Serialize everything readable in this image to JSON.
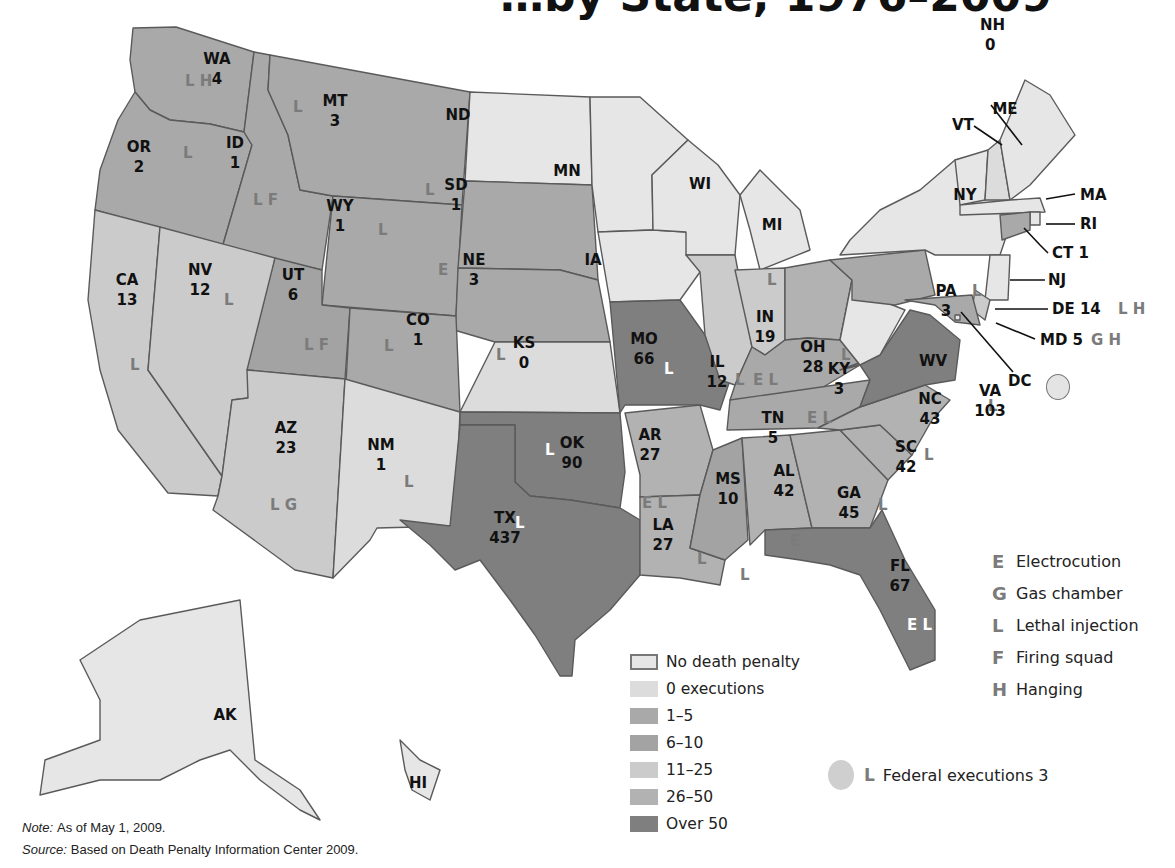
{
  "title_fragment": "…by State, 1976–2009",
  "colors": {
    "no_death_penalty": "#e6e6e6",
    "zero_executions": "#dcdcdc",
    "range_1_5": "#a9a9a9",
    "range_6_10": "#a3a3a3",
    "range_11_25": "#cbcbcb",
    "range_26_50": "#b2b2b2",
    "over_50": "#7f7f7f",
    "method_code": "#7b7b7b"
  },
  "legend_fill": [
    {
      "key": "no_death_penalty",
      "label": "No death penalty"
    },
    {
      "key": "zero_executions",
      "label": "0 executions"
    },
    {
      "key": "range_1_5",
      "label": "1–5"
    },
    {
      "key": "range_6_10",
      "label": "6–10"
    },
    {
      "key": "range_11_25",
      "label": "11–25"
    },
    {
      "key": "range_26_50",
      "label": "26–50"
    },
    {
      "key": "over_50",
      "label": "Over 50"
    }
  ],
  "legend_methods": [
    {
      "code": "E",
      "label": "Electrocution"
    },
    {
      "code": "G",
      "label": "Gas chamber"
    },
    {
      "code": "L",
      "label": "Lethal injection"
    },
    {
      "code": "F",
      "label": "Firing squad"
    },
    {
      "code": "H",
      "label": "Hanging"
    }
  ],
  "federal": {
    "code": "L",
    "label": "Federal executions 3"
  },
  "notes": {
    "note_label": "Note:",
    "note_text": "As of May 1, 2009.",
    "source_label": "Source:",
    "source_text": "Based on Death Penalty Information Center 2009."
  },
  "states": [
    {
      "abbr": "WA",
      "executions": "4",
      "methods": "L H",
      "category": "range_1_5"
    },
    {
      "abbr": "OR",
      "executions": "2",
      "methods": "L",
      "category": "range_1_5"
    },
    {
      "abbr": "ID",
      "executions": "1",
      "methods": "L F",
      "category": "range_1_5"
    },
    {
      "abbr": "MT",
      "executions": "3",
      "methods": "L",
      "category": "range_1_5"
    },
    {
      "abbr": "WY",
      "executions": "1",
      "methods": "L",
      "category": "range_1_5"
    },
    {
      "abbr": "ND",
      "executions": "",
      "methods": "",
      "category": "no_death_penalty"
    },
    {
      "abbr": "SD",
      "executions": "1",
      "methods": "L",
      "category": "range_1_5"
    },
    {
      "abbr": "NE",
      "executions": "3",
      "methods": "E",
      "category": "range_1_5"
    },
    {
      "abbr": "CA",
      "executions": "13",
      "methods": "L",
      "category": "range_11_25"
    },
    {
      "abbr": "NV",
      "executions": "12",
      "methods": "L",
      "category": "range_11_25"
    },
    {
      "abbr": "UT",
      "executions": "6",
      "methods": "L F",
      "category": "range_6_10"
    },
    {
      "abbr": "CO",
      "executions": "1",
      "methods": "L",
      "category": "range_1_5"
    },
    {
      "abbr": "KS",
      "executions": "0",
      "methods": "L",
      "category": "zero_executions"
    },
    {
      "abbr": "AZ",
      "executions": "23",
      "methods": "L G",
      "category": "range_11_25"
    },
    {
      "abbr": "NM",
      "executions": "1",
      "methods": "L",
      "category": "zero_executions"
    },
    {
      "abbr": "OK",
      "executions": "90",
      "methods": "L",
      "category": "over_50"
    },
    {
      "abbr": "TX",
      "executions": "437",
      "methods": "L",
      "category": "over_50"
    },
    {
      "abbr": "MN",
      "executions": "",
      "methods": "",
      "category": "no_death_penalty"
    },
    {
      "abbr": "IA",
      "executions": "",
      "methods": "",
      "category": "no_death_penalty"
    },
    {
      "abbr": "MO",
      "executions": "66",
      "methods": "L",
      "category": "over_50"
    },
    {
      "abbr": "AR",
      "executions": "27",
      "methods": "E L",
      "category": "range_26_50"
    },
    {
      "abbr": "LA",
      "executions": "27",
      "methods": "L",
      "category": "range_26_50"
    },
    {
      "abbr": "WI",
      "executions": "",
      "methods": "",
      "category": "no_death_penalty"
    },
    {
      "abbr": "IL",
      "executions": "12",
      "methods": "L",
      "category": "range_11_25"
    },
    {
      "abbr": "MI",
      "executions": "",
      "methods": "",
      "category": "no_death_penalty"
    },
    {
      "abbr": "IN",
      "executions": "19",
      "methods": "L",
      "category": "range_11_25"
    },
    {
      "abbr": "OH",
      "executions": "28",
      "methods": "L",
      "category": "range_26_50"
    },
    {
      "abbr": "KY",
      "executions": "3",
      "methods": "E L",
      "category": "range_1_5"
    },
    {
      "abbr": "TN",
      "executions": "5",
      "methods": "E L",
      "category": "range_1_5"
    },
    {
      "abbr": "MS",
      "executions": "10",
      "methods": "L",
      "category": "range_6_10"
    },
    {
      "abbr": "AL",
      "executions": "42",
      "methods": "E",
      "category": "range_26_50"
    },
    {
      "abbr": "GA",
      "executions": "45",
      "methods": "L",
      "category": "range_26_50"
    },
    {
      "abbr": "FL",
      "executions": "67",
      "methods": "E L",
      "category": "over_50"
    },
    {
      "abbr": "SC",
      "executions": "42",
      "methods": "L",
      "category": "range_26_50"
    },
    {
      "abbr": "NC",
      "executions": "43",
      "methods": "L",
      "category": "range_26_50"
    },
    {
      "abbr": "VA",
      "executions": "103",
      "methods": "L",
      "category": "over_50"
    },
    {
      "abbr": "WV",
      "executions": "",
      "methods": "",
      "category": "no_death_penalty"
    },
    {
      "abbr": "PA",
      "executions": "3",
      "methods": "L",
      "category": "range_1_5"
    },
    {
      "abbr": "NY",
      "executions": "",
      "methods": "",
      "category": "no_death_penalty"
    },
    {
      "abbr": "VT",
      "executions": "",
      "methods": "",
      "category": "no_death_penalty"
    },
    {
      "abbr": "NH",
      "executions": "0",
      "methods": "H",
      "category": "zero_executions"
    },
    {
      "abbr": "ME",
      "executions": "",
      "methods": "",
      "category": "no_death_penalty"
    },
    {
      "abbr": "MA",
      "executions": "",
      "methods": "",
      "category": "no_death_penalty"
    },
    {
      "abbr": "RI",
      "executions": "",
      "methods": "",
      "category": "no_death_penalty"
    },
    {
      "abbr": "CT",
      "executions": "1",
      "methods": "",
      "category": "range_1_5"
    },
    {
      "abbr": "NJ",
      "executions": "",
      "methods": "",
      "category": "no_death_penalty"
    },
    {
      "abbr": "DE",
      "executions": "14",
      "methods": "L H",
      "category": "range_11_25"
    },
    {
      "abbr": "MD",
      "executions": "5",
      "methods": "G H",
      "category": "range_1_5"
    },
    {
      "abbr": "DC",
      "executions": "",
      "methods": "",
      "category": "no_death_penalty"
    },
    {
      "abbr": "AK",
      "executions": "",
      "methods": "",
      "category": "no_death_penalty"
    },
    {
      "abbr": "HI",
      "executions": "",
      "methods": "",
      "category": "no_death_penalty"
    }
  ],
  "callout_labels": {
    "NH": "NH",
    "NH_count": "0",
    "VT": "VT",
    "MA": "MA",
    "RI": "RI",
    "CT": "CT 1",
    "NJ": "NJ",
    "DE": "DE 14",
    "DE_methods": "L H",
    "MD": "MD 5",
    "MD_methods": "G H",
    "DC": "DC"
  }
}
